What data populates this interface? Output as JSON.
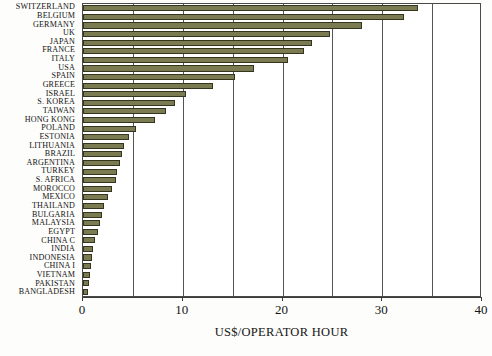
{
  "chart_data": {
    "type": "bar",
    "orientation": "horizontal",
    "title": "",
    "xlabel": "US$/OPERATOR HOUR",
    "ylabel": "",
    "xlim": [
      0,
      40
    ],
    "xticks": [
      0,
      10,
      20,
      30,
      40
    ],
    "xtick_labels": [
      "0",
      "10",
      "20",
      "30",
      "40"
    ],
    "minor_gridlines": [
      5,
      15,
      25,
      35
    ],
    "grid": true,
    "legend": null,
    "bar_color": "#7b7b52",
    "bar_edge_color": "#35351f",
    "categories": [
      "SWITZERLAND",
      "BELGIUM",
      "GERMANY",
      "UK",
      "JAPAN",
      "FRANCE",
      "ITALY",
      "USA",
      "SPAIN",
      "GREECE",
      "ISRAEL",
      "S. KOREA",
      "TAIWAN",
      "HONG KONG",
      "POLAND",
      "ESTONIA",
      "LITHUANIA",
      "BRAZIL",
      "ARGENTINA",
      "TURKEY",
      "S. AFRICA",
      "MOROCCO",
      "MEXICO",
      "THAILAND",
      "BULGARIA",
      "MALAYSIA",
      "EGYPT",
      "CHINA C",
      "INDIA",
      "INDONESIA",
      "CHINA I",
      "VIETNAM",
      "PAKISTAN",
      "BANGLADESH"
    ],
    "values": [
      33.6,
      32.2,
      28.0,
      24.8,
      23.0,
      22.2,
      20.6,
      17.1,
      15.2,
      13.0,
      10.3,
      9.2,
      8.3,
      7.2,
      5.3,
      4.6,
      4.1,
      3.9,
      3.7,
      3.4,
      3.3,
      2.9,
      2.5,
      2.1,
      1.9,
      1.7,
      1.5,
      1.2,
      1.0,
      0.9,
      0.8,
      0.7,
      0.6,
      0.5
    ]
  }
}
